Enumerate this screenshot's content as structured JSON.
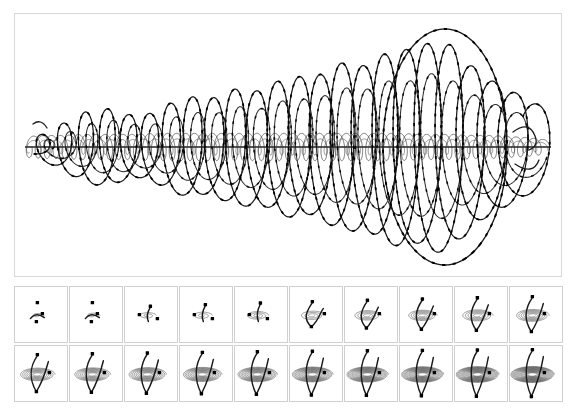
{
  "figure": {
    "caption": "",
    "background_color": "#ffffff",
    "border_color": "#d8d8d8",
    "curve_color": "#1a1a1a",
    "winding_color": "#444444",
    "marker_color": "#000000"
  },
  "main_panel": {
    "name": "main-trajectory-panel",
    "width": 548,
    "height": 264,
    "axis_centerline_y": 133,
    "notes": "Projected 3D helix: slow large-amplitude carrier oscillation modulated by a dense high-frequency winding band centred on the horizontal axis. Amplitude grows from left to right, with the largest excursions near the right end."
  },
  "chart_data": {
    "type": "line",
    "xlabel": "",
    "ylabel": "",
    "grid": false,
    "legend": "none",
    "xlim": [
      0,
      100
    ],
    "ylim": [
      -100,
      100
    ],
    "series": [
      {
        "name": "carrier-envelope-upper",
        "values": [
          6,
          14,
          22,
          30,
          34,
          30,
          26,
          30,
          38,
          44,
          40,
          46,
          52,
          48,
          56,
          62,
          58,
          66,
          74,
          70,
          78,
          86,
          82,
          92,
          88,
          72,
          60,
          52,
          44,
          36
        ]
      },
      {
        "name": "carrier-envelope-lower",
        "values": [
          -6,
          -14,
          -22,
          -30,
          -34,
          -30,
          -26,
          -30,
          -38,
          -44,
          -40,
          -46,
          -52,
          -48,
          -56,
          -62,
          -58,
          -66,
          -74,
          -70,
          -78,
          -86,
          -82,
          -92,
          -88,
          -72,
          -60,
          -52,
          -44,
          -36
        ]
      },
      {
        "name": "winding-band-amplitude",
        "values": [
          10,
          11,
          11,
          12,
          12,
          12,
          12,
          13,
          13,
          13,
          13,
          13,
          13,
          13,
          13,
          13,
          13,
          13,
          13,
          13,
          13,
          13,
          12,
          12,
          12,
          11,
          11,
          10,
          9,
          7
        ]
      }
    ],
    "annotations": [
      "large positive excursion near x = 80",
      "large negative excursion near x = 72",
      "trajectory endpoint hooks at right edge"
    ]
  },
  "frame_grid": {
    "name": "time-evolution-filmstrip",
    "rows": 2,
    "columns": 10,
    "total_frames": 20,
    "description": "Successive snapshots of the trajectory as it is traced out in time; the winding ellipse densifies and the arc grows into a V shape.",
    "frames": [
      {
        "index": 1,
        "label": "frame-01",
        "coils": 1,
        "arc": 0.1,
        "markers": 3
      },
      {
        "index": 2,
        "label": "frame-02",
        "coils": 1,
        "arc": 0.16,
        "markers": 3
      },
      {
        "index": 3,
        "label": "frame-03",
        "coils": 2,
        "arc": 0.22,
        "markers": 3
      },
      {
        "index": 4,
        "label": "frame-04",
        "coils": 2,
        "arc": 0.3,
        "markers": 3
      },
      {
        "index": 5,
        "label": "frame-05",
        "coils": 3,
        "arc": 0.38,
        "markers": 3
      },
      {
        "index": 6,
        "label": "frame-06",
        "coils": 3,
        "arc": 0.45,
        "markers": 3
      },
      {
        "index": 7,
        "label": "frame-07",
        "coils": 4,
        "arc": 0.52,
        "markers": 3
      },
      {
        "index": 8,
        "label": "frame-08",
        "coils": 5,
        "arc": 0.58,
        "markers": 3
      },
      {
        "index": 9,
        "label": "frame-09",
        "coils": 5,
        "arc": 0.64,
        "markers": 3
      },
      {
        "index": 10,
        "label": "frame-10",
        "coils": 6,
        "arc": 0.7,
        "markers": 3
      },
      {
        "index": 11,
        "label": "frame-11",
        "coils": 7,
        "arc": 0.75,
        "markers": 3
      },
      {
        "index": 12,
        "label": "frame-12",
        "coils": 8,
        "arc": 0.79,
        "markers": 3
      },
      {
        "index": 13,
        "label": "frame-13",
        "coils": 9,
        "arc": 0.83,
        "markers": 3
      },
      {
        "index": 14,
        "label": "frame-14",
        "coils": 10,
        "arc": 0.86,
        "markers": 3
      },
      {
        "index": 15,
        "label": "frame-15",
        "coils": 11,
        "arc": 0.89,
        "markers": 3
      },
      {
        "index": 16,
        "label": "frame-16",
        "coils": 12,
        "arc": 0.92,
        "markers": 3
      },
      {
        "index": 17,
        "label": "frame-17",
        "coils": 13,
        "arc": 0.94,
        "markers": 3
      },
      {
        "index": 18,
        "label": "frame-18",
        "coils": 14,
        "arc": 0.96,
        "markers": 3
      },
      {
        "index": 19,
        "label": "frame-19",
        "coils": 15,
        "arc": 0.98,
        "markers": 3
      },
      {
        "index": 20,
        "label": "frame-20",
        "coils": 16,
        "arc": 1.0,
        "markers": 3
      }
    ]
  }
}
